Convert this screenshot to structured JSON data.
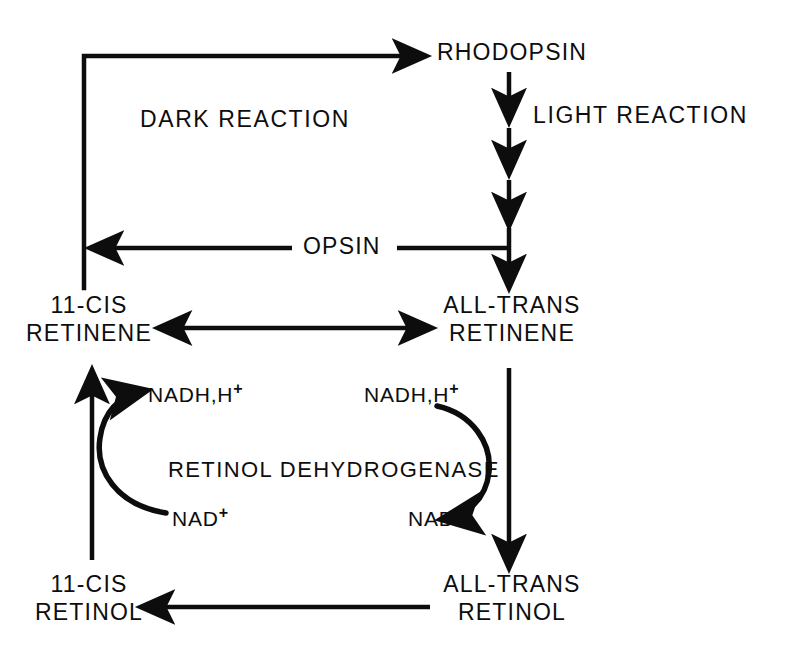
{
  "diagram": {
    "background_color": "#ffffff",
    "stroke_color": "#0d0d0d",
    "nodes": {
      "rhodopsin": "RHODOPSIN",
      "opsin": "OPSIN",
      "dark_reaction": "DARK REACTION",
      "light_reaction": "LIGHT REACTION",
      "cis_retinene_line1": "11-CIS",
      "cis_retinene_line2": "RETINENE",
      "trans_retinene_line1": "ALL-TRANS",
      "trans_retinene_line2": "RETINENE",
      "cis_retinol_line1": "11-CIS",
      "cis_retinol_line2": "RETINOL",
      "trans_retinol_line1": "ALL-TRANS",
      "trans_retinol_line2": "RETINOL",
      "enzyme": "RETINOL DEHYDROGENASE",
      "nadh_left_base": "NADH,H",
      "nadh_left_sup": "+",
      "nadh_right_base": "NADH,H",
      "nadh_right_sup": "+",
      "nad_left_base": "NAD",
      "nad_left_sup": "+",
      "nad_right_base": "NAD",
      "nad_right_sup": "+"
    }
  }
}
